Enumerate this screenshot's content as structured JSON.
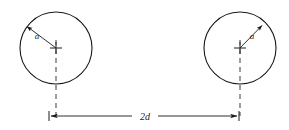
{
  "figure": {
    "type": "geometry-diagram",
    "background_color": "#ffffff",
    "stroke_color": "#1a1a1a",
    "dash_color": "#3a3a3a",
    "canvas": {
      "width": 289,
      "height": 130
    }
  },
  "circles": [
    {
      "id": "left-circle",
      "center": {
        "x": 56,
        "y": 48
      },
      "radius": 36,
      "radius_label": "a",
      "radius_label_pos": {
        "x": 37,
        "y": 39
      },
      "arrow": {
        "from": {
          "x": 56,
          "y": 48
        },
        "to": {
          "x": 25,
          "y": 25
        }
      },
      "centerline": {
        "x": 56,
        "y_top": 40,
        "y_bottom": 116
      }
    },
    {
      "id": "right-circle",
      "center": {
        "x": 240,
        "y": 48
      },
      "radius": 36,
      "radius_label": "a",
      "radius_label_pos": {
        "x": 252,
        "y": 39
      },
      "arrow": {
        "from": {
          "x": 240,
          "y": 48
        },
        "to": {
          "x": 264,
          "y": 24
        }
      },
      "centerline": {
        "x": 240,
        "y_top": 40,
        "y_bottom": 116
      }
    }
  ],
  "dimension": {
    "label": "2d",
    "label_pos": {
      "x": 145,
      "y": 113
    },
    "y": 116,
    "x_start": 49,
    "x_end": 239,
    "gap_left": 132,
    "gap_right": 158,
    "tick_height": 9
  },
  "markers": {
    "center_cross_size": 6
  }
}
